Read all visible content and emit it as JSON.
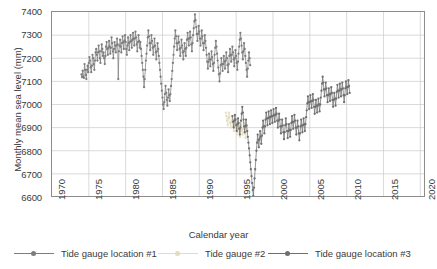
{
  "chart_data": {
    "type": "line",
    "title": "",
    "xlabel": "Calendar year",
    "ylabel": "Monthly mean sea level (mm)",
    "xlim": [
      1970,
      2020.5
    ],
    "ylim": [
      6600,
      7400
    ],
    "xticks": [
      1970,
      1975,
      1980,
      1985,
      1990,
      1995,
      2000,
      2005,
      2010,
      2015,
      2020
    ],
    "yticks": [
      6600,
      6700,
      6800,
      6900,
      7000,
      7100,
      7200,
      7300,
      7400
    ],
    "grid": true,
    "legend_position": "bottom",
    "marker": "circle",
    "series": [
      {
        "name": "Tide gauge location #1",
        "color": "#7d7d7d",
        "x_start": 1974.0,
        "x_step": 0.0833,
        "values": [
          7130,
          7118,
          7146,
          7122,
          7115,
          7175,
          7150,
          7128,
          7110,
          7150,
          7168,
          7140,
          7180,
          7205,
          7190,
          7160,
          7140,
          7168,
          7215,
          7200,
          7175,
          7150,
          7190,
          7225,
          7240,
          7215,
          7190,
          7225,
          7255,
          7230,
          7200,
          7180,
          7230,
          7260,
          7240,
          7210,
          7225,
          7200,
          7175,
          7210,
          7250,
          7270,
          7240,
          7215,
          7245,
          7275,
          7250,
          7220,
          7245,
          7290,
          7265,
          7230,
          7200,
          7240,
          7270,
          7255,
          7225,
          7255,
          7285,
          7260,
          7110,
          7230,
          7255,
          7280,
          7250,
          7225,
          7265,
          7295,
          7270,
          7240,
          7275,
          7300,
          7270,
          7240,
          7215,
          7255,
          7290,
          7265,
          7235,
          7270,
          7300,
          7275,
          7245,
          7280,
          7310,
          7285,
          7255,
          7285,
          7315,
          7290,
          7260,
          7230,
          7270,
          7300,
          7275,
          7245,
          7270,
          7240,
          7210,
          7180,
          7150,
          7120,
          7075,
          7110,
          7150,
          7190,
          7220,
          7255,
          7290,
          7320,
          7295,
          7265,
          7235,
          7265,
          7300,
          7275,
          7245,
          7215,
          7250,
          7285,
          7255,
          7225,
          7195,
          7230,
          7265,
          7240,
          7210,
          7180,
          7150,
          7120,
          7090,
          7060,
          7030,
          7000,
          6980,
          7010,
          7045,
          7080,
          7050,
          7020,
          6995,
          7030,
          7065,
          7040,
          7015,
          7045,
          7080,
          7110,
          7145,
          7180,
          7215,
          7250,
          7285,
          7320,
          7295,
          7265,
          7235,
          7265,
          7295,
          7270,
          7240,
          7210,
          7245,
          7280,
          7255,
          7225,
          7195,
          7230,
          7265,
          7240,
          7210,
          7245,
          7280,
          7310,
          7285,
          7255,
          7285,
          7315,
          7290,
          7260,
          7230,
          7265,
          7300,
          7330,
          7360,
          7390,
          7365,
          7335,
          7305,
          7275,
          7305,
          7340,
          7315,
          7285,
          7255,
          7285,
          7320,
          7295,
          7265,
          7235,
          7265,
          7300,
          7275,
          7245,
          7215,
          7185,
          7155,
          7185,
          7220,
          7195,
          7165,
          7195,
          7230,
          7205,
          7175,
          7145,
          7180,
          7215,
          7245,
          7275,
          7250,
          7220,
          7190,
          7160,
          7130,
          7100,
          7135,
          7170,
          7200,
          7175,
          7145,
          7175,
          7210,
          7185,
          7155,
          7190,
          7225,
          7200,
          7170,
          7140,
          7175,
          7210,
          7240,
          7215,
          7185,
          7215,
          7250,
          7225,
          7195,
          7165,
          7200,
          7235,
          7210,
          7180,
          7150,
          7185,
          7220,
          7250,
          7280,
          7310,
          7285,
          7255,
          7225,
          7195,
          7230,
          7265,
          7240,
          7210,
          7180,
          7150,
          7120,
          7155,
          7190,
          7225,
          7200,
          7170
        ]
      },
      {
        "name": "Tide gauge #2",
        "color": "#e2dcc0",
        "x_start": 1993.6,
        "x_step": 0.0833,
        "values": [
          6965,
          6950,
          6930,
          6910,
          6940,
          6965,
          6945,
          6920,
          6900,
          6925,
          6950,
          6930,
          6905,
          6885,
          6910,
          6935,
          6915,
          6890,
          6870,
          6895,
          6920,
          6900,
          6880,
          6860,
          6885,
          6910,
          6890,
          6870,
          6895,
          6920,
          6900,
          6875,
          6855,
          6880,
          6905,
          6885
        ]
      },
      {
        "name": "Tide gauge location #3",
        "color": "#6f6f6f",
        "x_start": 1994.5,
        "x_step": 0.0833,
        "values": [
          6950,
          6925,
          6900,
          6930,
          6955,
          6935,
          6910,
          6885,
          6915,
          6940,
          6920,
          6895,
          6870,
          6900,
          6930,
          6960,
          6990,
          6965,
          6935,
          6905,
          6880,
          6905,
          6935,
          6910,
          6885,
          6860,
          6835,
          6810,
          6780,
          6750,
          6720,
          6690,
          6660,
          6630,
          6605,
          6640,
          6680,
          6720,
          6760,
          6800,
          6835,
          6870,
          6845,
          6815,
          6850,
          6885,
          6860,
          6830,
          6865,
          6900,
          6930,
          6905,
          6875,
          6905,
          6935,
          6965,
          6940,
          6910,
          6940,
          6970,
          6945,
          6915,
          6945,
          6975,
          6950,
          6920,
          6950,
          6980,
          6955,
          6925,
          6955,
          6985,
          6960,
          6930,
          6900,
          6930,
          6960,
          6935,
          6905,
          6875,
          6905,
          6935,
          6910,
          6880,
          6850,
          6880,
          6910,
          6940,
          6915,
          6885,
          6855,
          6885,
          6915,
          6890,
          6860,
          6890,
          6920,
          6950,
          6925,
          6895,
          6925,
          6955,
          6930,
          6900,
          6870,
          6900,
          6930,
          6905,
          6875,
          6845,
          6875,
          6905,
          6935,
          6910,
          6880,
          6910,
          6940,
          6915,
          6885,
          6915,
          6945,
          6975,
          7005,
          7035,
          7010,
          6980,
          7010,
          7040,
          7015,
          6985,
          7015,
          7045,
          7020,
          6990,
          6960,
          6990,
          7020,
          6995,
          6965,
          6995,
          7025,
          7000,
          6970,
          7000,
          7030,
          7060,
          7090,
          7120,
          7095,
          7065,
          7035,
          7065,
          7095,
          7070,
          7040,
          7010,
          7040,
          7070,
          7045,
          7015,
          7045,
          7075,
          7050,
          7020,
          6990,
          7020,
          7050,
          7025,
          6995,
          7025,
          7055,
          7085,
          7060,
          7030,
          7060,
          7090,
          7065,
          7035,
          7065,
          7095,
          7070,
          7040,
          7010,
          7040,
          7070,
          7100,
          7075,
          7045,
          7075,
          7105,
          7080,
          7050
        ]
      }
    ]
  },
  "axes": {
    "y_title": "Monthly mean sea level (mm)",
    "x_title": "Calendar year",
    "y_tick_labels": [
      "7400",
      "7300",
      "7200",
      "7100",
      "7000",
      "6900",
      "6800",
      "6700",
      "6600"
    ],
    "x_tick_labels": [
      "1970",
      "1975",
      "1980",
      "1985",
      "1990",
      "1995",
      "2000",
      "2005",
      "2010",
      "2015",
      "2020"
    ]
  },
  "legend": {
    "items": [
      {
        "label": "Tide gauge location #1",
        "color": "#7d7d7d"
      },
      {
        "label": "Tide gauge #2",
        "color": "#e2dcc0"
      },
      {
        "label": "Tide gauge location #3",
        "color": "#6f6f6f"
      }
    ]
  },
  "style": {
    "grid_color": "#c9c9c9",
    "frame_color": "#8c8c8c",
    "text_color": "#3a3a3a"
  }
}
